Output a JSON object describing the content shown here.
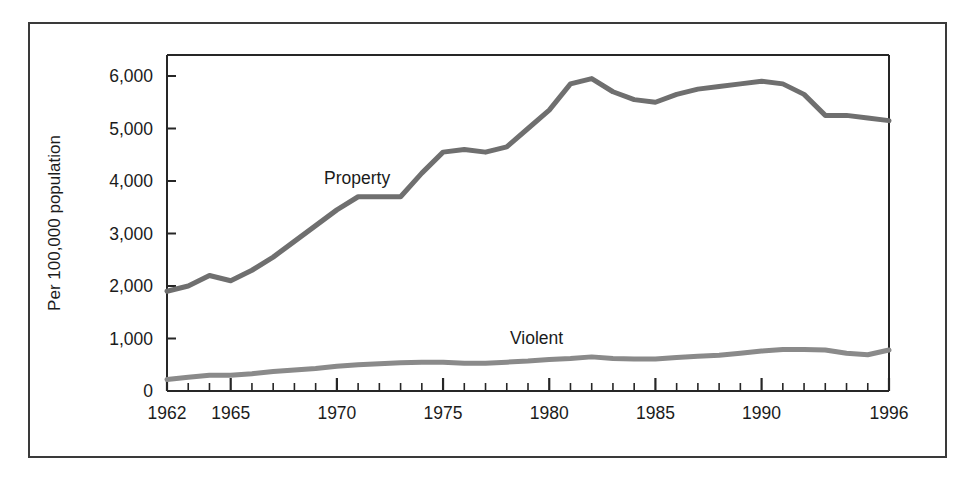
{
  "chart_data": {
    "type": "line",
    "title": "",
    "subtitle": "",
    "xlabel": "",
    "ylabel": "Per 100,000 population",
    "x": [
      1962,
      1963,
      1964,
      1965,
      1966,
      1967,
      1968,
      1969,
      1970,
      1971,
      1972,
      1973,
      1974,
      1975,
      1976,
      1977,
      1978,
      1979,
      1980,
      1981,
      1982,
      1983,
      1984,
      1985,
      1986,
      1987,
      1988,
      1989,
      1990,
      1991,
      1992,
      1993,
      1994,
      1995,
      1996
    ],
    "xlim": [
      1962,
      1996
    ],
    "ylim": [
      0,
      6400
    ],
    "ytick_values": [
      0,
      1000,
      2000,
      3000,
      4000,
      5000,
      6000
    ],
    "ytick_labels": [
      "0",
      "1,000",
      "2,000",
      "3,000",
      "4,000",
      "5,000",
      "6,000"
    ],
    "xtick_major_values": [
      1962,
      1965,
      1970,
      1975,
      1980,
      1985,
      1990,
      1996
    ],
    "xtick_major_labels": [
      "1962",
      "1965",
      "1970",
      "1975",
      "1980",
      "1985",
      "1990",
      "1996"
    ],
    "xtick_minor_step": 1,
    "grid": false,
    "legend_position": "inline-annotations",
    "series": [
      {
        "name": "Property",
        "label_text": "Property",
        "color": "#6f6f6f",
        "line_width": 5,
        "values": [
          1900,
          2000,
          2200,
          2100,
          2300,
          2550,
          2850,
          3150,
          3450,
          3700,
          3700,
          3700,
          4150,
          4550,
          4600,
          4550,
          4650,
          5000,
          5350,
          5850,
          5950,
          5700,
          5550,
          5500,
          5650,
          5750,
          5800,
          5850,
          5900,
          5850,
          5650,
          5250,
          5250,
          5200,
          5150
        ]
      },
      {
        "name": "Violent",
        "label_text": "Violent",
        "color": "#8a8a8a",
        "line_width": 5,
        "values": [
          220,
          260,
          300,
          300,
          330,
          370,
          400,
          430,
          470,
          500,
          520,
          540,
          550,
          550,
          530,
          530,
          550,
          570,
          600,
          620,
          650,
          620,
          610,
          610,
          640,
          660,
          680,
          720,
          760,
          790,
          790,
          780,
          720,
          690,
          780
        ]
      }
    ],
    "annotations": [
      {
        "text": "Property",
        "x_px": 322,
        "y_px": 182
      },
      {
        "text": "Violent",
        "x_px": 508,
        "y_px": 342
      }
    ]
  },
  "figure": {
    "border_color": "#3a3a3a",
    "background": "#ffffff",
    "axis_color": "#262626"
  }
}
